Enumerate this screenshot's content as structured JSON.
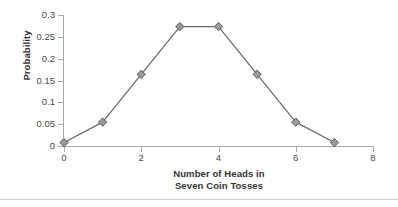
{
  "chart_data": {
    "type": "line",
    "title": "",
    "xlabel_line1": "Number of Heads in",
    "xlabel_line2": "Seven Coin Tosses",
    "ylabel": "Probability",
    "x": [
      0,
      1,
      2,
      3,
      4,
      5,
      6,
      7
    ],
    "values": [
      0.0078,
      0.0547,
      0.1641,
      0.2734,
      0.2734,
      0.1641,
      0.0547,
      0.0078
    ],
    "series": [
      {
        "name": "Probability",
        "values": [
          0.0078,
          0.0547,
          0.1641,
          0.2734,
          0.2734,
          0.1641,
          0.0547,
          0.0078
        ]
      }
    ],
    "xlim": [
      0,
      8
    ],
    "ylim": [
      0,
      0.3
    ],
    "x_ticks": [
      0,
      2,
      4,
      6,
      8
    ],
    "x_tick_labels": [
      "0",
      "2",
      "4",
      "6",
      "8"
    ],
    "y_ticks": [
      0,
      0.05,
      0.1,
      0.15,
      0.2,
      0.25,
      0.3
    ],
    "y_tick_labels": [
      "0",
      "0.05",
      "0.1",
      "0.15",
      "0.2",
      "0.25",
      "0.3"
    ],
    "grid": false,
    "legend": false,
    "marker": "diamond",
    "colors": {
      "line": "#666666",
      "marker_fill": "#9a9a9a",
      "marker_stroke": "#5e5e5e",
      "axis": "#a8a8a8",
      "tick_label": "#4a4a4a",
      "axis_title": "#333333",
      "rule": "#cfcfcf",
      "background": "#ffffff"
    }
  }
}
